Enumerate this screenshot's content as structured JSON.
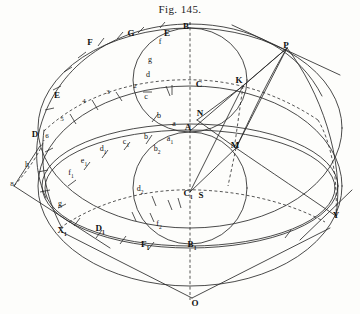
{
  "figure": {
    "title": "Fig. 145.",
    "kind": "geometric construction drawing",
    "ink_color": "#2b2b2b",
    "paper_color": "#fdfdfb"
  },
  "points": [
    {
      "id": "B",
      "label": "B",
      "style": "cap",
      "x": 186,
      "y": 26
    },
    {
      "id": "G",
      "label": "G",
      "style": "cap",
      "x": 131,
      "y": 33
    },
    {
      "id": "E",
      "label": "E",
      "style": "cap",
      "x": 167,
      "y": 33
    },
    {
      "id": "F",
      "label": "F",
      "style": "cap",
      "x": 90,
      "y": 42
    },
    {
      "id": "P",
      "label": "P",
      "style": "cap",
      "x": 286,
      "y": 45
    },
    {
      "id": "Eleft",
      "label": "E",
      "style": "cap",
      "x": 57,
      "y": 95
    },
    {
      "id": "C",
      "label": "C",
      "style": "cap",
      "x": 199,
      "y": 84
    },
    {
      "id": "K",
      "label": "K",
      "style": "cap",
      "x": 239,
      "y": 80
    },
    {
      "id": "N",
      "label": "N",
      "style": "cap",
      "x": 200,
      "y": 113
    },
    {
      "id": "A",
      "label": "A",
      "style": "cap",
      "x": 188,
      "y": 127
    },
    {
      "id": "D",
      "label": "D",
      "style": "cap",
      "x": 35,
      "y": 134
    },
    {
      "id": "M",
      "label": "M",
      "style": "cap",
      "x": 235,
      "y": 145
    },
    {
      "id": "C1",
      "label": "C",
      "style": "cap",
      "x": 188,
      "y": 195,
      "subscript": "1"
    },
    {
      "id": "S",
      "label": "S",
      "style": "cap",
      "x": 200,
      "y": 195
    },
    {
      "id": "Y",
      "label": "Y",
      "style": "cap",
      "x": 336,
      "y": 215
    },
    {
      "id": "X1",
      "label": "X",
      "style": "cap",
      "x": 62,
      "y": 232,
      "subscript": "1"
    },
    {
      "id": "D1",
      "label": "D",
      "style": "cap",
      "x": 100,
      "y": 230,
      "subscript": "1"
    },
    {
      "id": "F1",
      "label": "F",
      "style": "cap",
      "x": 145,
      "y": 246,
      "subscript": "1"
    },
    {
      "id": "B1",
      "label": "B",
      "style": "cap",
      "x": 192,
      "y": 246,
      "subscript": "1"
    },
    {
      "id": "O",
      "label": "O",
      "style": "cap",
      "x": 195,
      "y": 303
    }
  ],
  "divisions_upper_inner": [
    {
      "label": "f",
      "x": 160,
      "y": 42
    },
    {
      "label": "g",
      "x": 150,
      "y": 60
    },
    {
      "label": "d",
      "x": 148,
      "y": 75
    },
    {
      "label": "c",
      "x": 146,
      "y": 97
    },
    {
      "label": "b",
      "x": 159,
      "y": 116
    },
    {
      "label": "a",
      "x": 174,
      "y": 124
    }
  ],
  "divisions_upper_outer_numbers": [
    {
      "label": "2",
      "x": 135,
      "y": 86
    },
    {
      "label": "3",
      "x": 108,
      "y": 92
    },
    {
      "label": "4",
      "x": 84,
      "y": 101
    },
    {
      "label": "5",
      "x": 62,
      "y": 119
    },
    {
      "label": "6",
      "x": 47,
      "y": 136
    }
  ],
  "divisions_mid_letters": [
    {
      "label": "b",
      "x": 146,
      "y": 137
    },
    {
      "label": "c",
      "x": 126,
      "y": 143,
      "subscript": "1"
    },
    {
      "label": "d",
      "x": 103,
      "y": 150,
      "subscript": "1"
    },
    {
      "label": "e",
      "x": 84,
      "y": 162,
      "subscript": "1"
    },
    {
      "label": "f",
      "x": 71,
      "y": 174,
      "subscript": "1"
    },
    {
      "label": "g",
      "x": 60,
      "y": 204
    },
    {
      "label": "a",
      "x": 170,
      "y": 140,
      "subscript": "1"
    },
    {
      "label": "b",
      "x": 157,
      "y": 150,
      "subscript": "2"
    },
    {
      "label": "d",
      "x": 140,
      "y": 190,
      "subscript": "2"
    },
    {
      "label": "f",
      "x": 159,
      "y": 225,
      "subscript": "2"
    },
    {
      "label": "h",
      "x": 27,
      "y": 165
    },
    {
      "label": "8",
      "x": 12,
      "y": 184
    }
  ],
  "annotations": {
    "description": "Sphere projection with two great-circle ellipses, division ticks and tangent construction lines",
    "axis": "vertical dashed center line through B, C, N, A, C1, S, B1, O"
  }
}
